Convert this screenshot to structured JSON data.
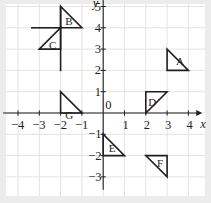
{
  "figure": {
    "type": "coordinate-plane",
    "title": "",
    "background_color": "#ffffff",
    "outer_color": "#ececed",
    "grid_color": "#e3e3e5",
    "axis_color": "#231f20",
    "shape_color": "#231f20"
  },
  "axes": {
    "x": {
      "name": "x",
      "min": -4.7,
      "max": 4.65,
      "tick_values": [
        -4,
        -3,
        -2,
        -1,
        1,
        2,
        3,
        4
      ],
      "tick_labels": [
        "−4",
        "−3",
        "−2",
        "−1",
        "1",
        "2",
        "3",
        "4"
      ],
      "arrow": "right"
    },
    "y": {
      "name": "y",
      "min": -3.6,
      "max": 5.6,
      "tick_values": [
        -3,
        -2,
        -1,
        1,
        2,
        3,
        4,
        5
      ],
      "tick_labels": [
        "−3",
        "−2",
        "−1",
        "1",
        "2",
        "3",
        "4",
        "5"
      ],
      "arrow": "up"
    },
    "origin_label": "0"
  },
  "chart_data": {
    "type": "scatter",
    "title": "",
    "xlabel": "x",
    "ylabel": "y",
    "xlim": [
      -4.7,
      4.65
    ],
    "ylim": [
      -3.6,
      5.6
    ],
    "grid": true,
    "legend": "none",
    "shapes": [
      {
        "label": "A",
        "kind": "right-triangle",
        "vertices": [
          [
            3,
            3
          ],
          [
            3,
            2
          ],
          [
            4,
            2
          ]
        ],
        "right_angle_at": [
          3,
          2
        ],
        "label_position": [
          3.42,
          2.42
        ]
      },
      {
        "label": "B",
        "kind": "right-triangle",
        "vertices": [
          [
            -2,
            5
          ],
          [
            -2,
            4
          ],
          [
            -1,
            4
          ]
        ],
        "right_angle_at": [
          -2,
          4
        ],
        "label_position": [
          -1.78,
          4.3
        ]
      },
      {
        "label": "C",
        "kind": "right-triangle",
        "vertices": [
          [
            -3,
            3
          ],
          [
            -2,
            4
          ],
          [
            -2,
            3
          ]
        ],
        "right_angle_at": [
          -2,
          3
        ],
        "label_position": [
          -2.55,
          3.18
        ]
      },
      {
        "label": "D",
        "kind": "right-triangle",
        "vertices": [
          [
            2,
            0
          ],
          [
            2,
            1
          ],
          [
            3,
            1
          ]
        ],
        "right_angle_at": [
          2,
          1
        ],
        "label_position": [
          2.12,
          0.48
        ]
      },
      {
        "label": "E",
        "kind": "right-triangle",
        "vertices": [
          [
            0,
            -1
          ],
          [
            0,
            -2
          ],
          [
            1,
            -2
          ]
        ],
        "right_angle_at": [
          0,
          -2
        ],
        "label_position": [
          0.26,
          -1.68
        ]
      },
      {
        "label": "F",
        "kind": "right-triangle",
        "vertices": [
          [
            2,
            -2
          ],
          [
            3,
            -2
          ],
          [
            3,
            -3
          ]
        ],
        "right_angle_at": [
          2,
          -2
        ],
        "label_position": [
          2.52,
          -2.35
        ]
      },
      {
        "label": "G",
        "kind": "right-triangle",
        "vertices": [
          [
            -2,
            0
          ],
          [
            -2,
            1
          ],
          [
            -1,
            0
          ]
        ],
        "right_angle_at": [
          -2,
          0
        ],
        "label_position": [
          -1.78,
          -0.12
        ]
      }
    ],
    "extra_lines": [
      {
        "name": "b-c-vertical-extension",
        "from": [
          -2,
          5
        ],
        "to": [
          -2,
          2
        ]
      },
      {
        "name": "c-top-horizontal-extension",
        "from": [
          -3.35,
          4
        ],
        "to": [
          -2,
          4
        ]
      }
    ]
  }
}
